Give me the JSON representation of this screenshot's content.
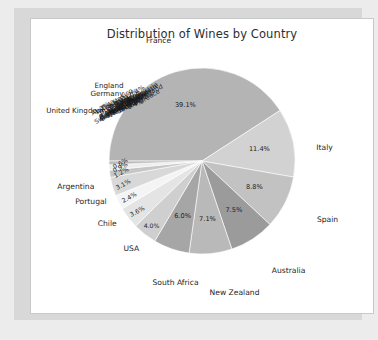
{
  "chart_data": {
    "type": "pie",
    "title": "Distribution of Wines by Country",
    "xlabel": "",
    "ylabel": "",
    "legend": "none",
    "grid": false,
    "labels": [
      "France",
      "Italy",
      "Spain",
      "Australia",
      "New Zealand",
      "South Africa",
      "USA",
      "Chile",
      "Portugal",
      "Argentina",
      "England",
      "Germany",
      "United Kingdom"
    ],
    "categories": [
      "France",
      "Italy",
      "Spain",
      "Australia",
      "New Zealand",
      "South Africa",
      "USA",
      "Chile",
      "Portugal",
      "Argentina",
      "England",
      "Germany",
      "United Kingdom"
    ],
    "values": [
      39.1,
      11.4,
      8.8,
      7.5,
      7.1,
      6.0,
      4.0,
      3.6,
      2.4,
      3.1,
      1.2,
      0.9,
      0.6
    ],
    "value_labels": [
      "39.1%",
      "11.4%",
      "8.8%",
      "7.5%",
      "7.1%",
      "6.0%",
      "4.0%",
      "3.6%",
      "2.4%",
      "3.1%",
      "1.2%",
      "0.9%",
      "0.6%"
    ],
    "units": "percent",
    "slice_colors": [
      "#b4b4b4",
      "#d2d2d2",
      "#c2c2c2",
      "#9b9b9b",
      "#b9b9b9",
      "#a6a6a6",
      "#cfcfcf",
      "#e4e4e4",
      "#f4f4f4",
      "#d8d8d8",
      "#c6c6c6",
      "#ededed",
      "#bdbdbd"
    ],
    "note": "Grayscale pie chart; many small slices in the upper-left have overlapping illegible labels"
  },
  "slices": [
    {
      "label": "France",
      "pct": "39.1%",
      "color": "#b4b4b4"
    },
    {
      "label": "Italy",
      "pct": "11.4%",
      "color": "#d2d2d2"
    },
    {
      "label": "Spain",
      "pct": "8.8%",
      "color": "#c2c2c2"
    },
    {
      "label": "Australia",
      "pct": "7.5%",
      "color": "#9b9b9b"
    },
    {
      "label": "New Zealand",
      "pct": "7.1%",
      "color": "#b9b9b9"
    },
    {
      "label": "South Africa",
      "pct": "6.0%",
      "color": "#a6a6a6"
    },
    {
      "label": "USA",
      "pct": "4.0%",
      "color": "#cfcfcf"
    },
    {
      "label": "Chile",
      "pct": "3.6%",
      "color": "#e4e4e4"
    },
    {
      "label": "Portugal",
      "pct": "2.4%",
      "color": "#f4f4f4"
    },
    {
      "label": "Argentina",
      "pct": "3.1%",
      "color": "#d8d8d8"
    },
    {
      "label": "England",
      "pct": "1.2%",
      "color": "#c6c6c6"
    },
    {
      "label": "Germany",
      "pct": "0.9%",
      "color": "#ededed"
    },
    {
      "label": "United Kingdom",
      "pct": "0.6%",
      "color": "#bdbdbd"
    }
  ],
  "pile_labels": [
    "Switzerland",
    "Austria",
    "Greece",
    "Hungary",
    "Romania",
    "Bulgaria",
    "Croatia",
    "Slovenia",
    "Georgia",
    "Moldova",
    "Uruguay",
    "Canada",
    "Mexico",
    "Brazil",
    "Japan",
    "China",
    "India",
    "Israel",
    "Lebanon",
    "Turkey"
  ],
  "pile_pcts": [
    "1.2%",
    "0.9%",
    "0.6%",
    "0.4%",
    "0.3%"
  ]
}
